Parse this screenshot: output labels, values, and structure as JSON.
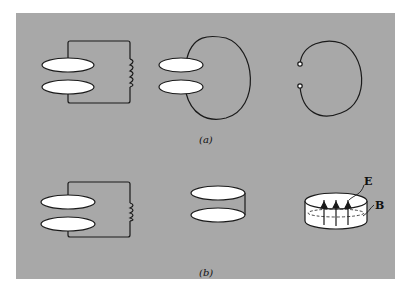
{
  "figure": {
    "background_color": "#a8a8a8",
    "plate_color": "#ffffff",
    "line_color": "#1a1a1a",
    "panels": [
      {
        "id": "a",
        "label": "(a)",
        "stages": [
          "lc-circuit",
          "single-loop-inductor",
          "open-loop"
        ]
      },
      {
        "id": "b",
        "label": "(b)",
        "stages": [
          "lc-circuit",
          "closed-cylinder-plates",
          "cavity-resonator"
        ]
      }
    ],
    "field_labels": {
      "electric": "E",
      "magnetic": "B"
    }
  }
}
